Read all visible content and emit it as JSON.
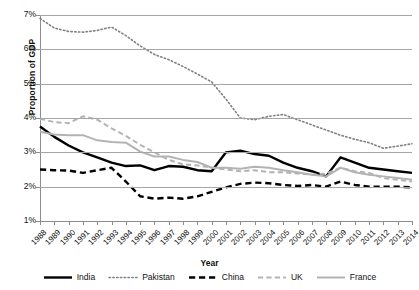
{
  "chart_data": {
    "type": "line",
    "title": "",
    "xlabel": "Year",
    "ylabel": "Proportion of GDP",
    "ylim": [
      1,
      7
    ],
    "ytick_labels": [
      "1%",
      "2%",
      "3%",
      "4%",
      "5%",
      "6%",
      "7%"
    ],
    "ytick_values": [
      1,
      2,
      3,
      4,
      5,
      6,
      7
    ],
    "grid": true,
    "legend_position": "bottom",
    "categories": [
      "1988",
      "1989",
      "1990",
      "1991",
      "1992",
      "1993",
      "1994",
      "1995",
      "1996",
      "1997",
      "1998",
      "1999",
      "2000",
      "2001",
      "2002",
      "2003",
      "2004",
      "2005",
      "2006",
      "2007",
      "2008",
      "2009",
      "2010",
      "2011",
      "2012",
      "2013",
      "2014"
    ],
    "series": [
      {
        "name": "India",
        "style": "solid",
        "color": "#000000",
        "width": 2.4,
        "values": [
          3.75,
          3.45,
          3.2,
          3.0,
          2.85,
          2.7,
          2.6,
          2.62,
          2.48,
          2.6,
          2.58,
          2.48,
          2.45,
          3.0,
          3.05,
          2.95,
          2.9,
          2.7,
          2.55,
          2.45,
          2.3,
          2.85,
          2.7,
          2.55,
          2.5,
          2.45,
          2.4
        ]
      },
      {
        "name": "Pakistan",
        "style": "dotted",
        "color": "#808080",
        "width": 1.6,
        "values": [
          6.9,
          6.62,
          6.52,
          6.5,
          6.55,
          6.65,
          6.4,
          6.1,
          5.85,
          5.7,
          5.5,
          5.28,
          5.05,
          4.55,
          4.0,
          3.95,
          4.05,
          4.1,
          3.95,
          3.8,
          3.65,
          3.5,
          3.38,
          3.28,
          3.12,
          3.18,
          3.25
        ]
      },
      {
        "name": "China",
        "style": "dashed",
        "color": "#000000",
        "width": 2.4,
        "values": [
          2.5,
          2.48,
          2.47,
          2.4,
          2.48,
          2.55,
          2.15,
          1.72,
          1.65,
          1.68,
          1.65,
          1.72,
          1.85,
          1.98,
          2.08,
          2.12,
          2.1,
          2.05,
          2.02,
          2.05,
          2.0,
          2.15,
          2.05,
          2.0,
          2.0,
          2.0,
          1.98
        ]
      },
      {
        "name": "UK",
        "style": "dashed",
        "color": "#b3b3b3",
        "width": 2.0,
        "values": [
          3.98,
          3.88,
          3.85,
          4.05,
          3.95,
          3.7,
          3.48,
          3.22,
          3.0,
          2.78,
          2.65,
          2.62,
          2.55,
          2.5,
          2.45,
          2.48,
          2.42,
          2.42,
          2.38,
          2.35,
          2.38,
          2.55,
          2.45,
          2.4,
          2.25,
          2.2,
          2.15
        ]
      },
      {
        "name": "France",
        "style": "solid",
        "color": "#b3b3b3",
        "width": 2.0,
        "values": [
          3.6,
          3.52,
          3.5,
          3.5,
          3.35,
          3.3,
          3.28,
          3.02,
          2.88,
          2.88,
          2.78,
          2.72,
          2.55,
          2.55,
          2.52,
          2.58,
          2.55,
          2.48,
          2.42,
          2.35,
          2.3,
          2.55,
          2.42,
          2.35,
          2.3,
          2.25,
          2.2
        ]
      }
    ]
  },
  "legend": {
    "items": [
      {
        "label": "India"
      },
      {
        "label": "Pakistan"
      },
      {
        "label": "China"
      },
      {
        "label": "UK"
      },
      {
        "label": "France"
      }
    ]
  }
}
